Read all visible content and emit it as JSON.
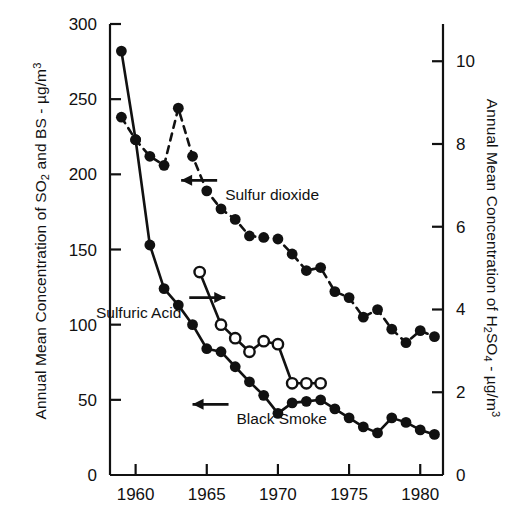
{
  "chart_data": {
    "type": "line",
    "title": "",
    "xlabel": "",
    "ylabel_left": "Annual Mean Concentration of SO2 and BS - µg/m3",
    "ylabel_right": "Annual Mean Concentration of H2SO4 - µg/m3",
    "x": [
      1959,
      1960,
      1961,
      1962,
      1963,
      1964,
      1965,
      1966,
      1967,
      1968,
      1969,
      1970,
      1971,
      1972,
      1973,
      1974,
      1975,
      1976,
      1977,
      1978,
      1979,
      1980,
      1981
    ],
    "xlim": [
      1958.2,
      1981.6
    ],
    "xticks": [
      1960,
      1965,
      1970,
      1975,
      1980
    ],
    "xticklabels": [
      "1960",
      "1965",
      "1970",
      "1975",
      "1980"
    ],
    "ylim_left": [
      0,
      300
    ],
    "yticks_left": [
      0,
      50,
      100,
      150,
      200,
      250,
      300
    ],
    "yticklabels_left": [
      "0",
      "50",
      "100",
      "150",
      "200",
      "250",
      "300"
    ],
    "ylim_right": [
      0,
      10.9
    ],
    "yticks_right": [
      0,
      2,
      4,
      6,
      8,
      10
    ],
    "yticklabels_right": [
      "0",
      "2",
      "4",
      "6",
      "8",
      "10"
    ],
    "grid": false,
    "legend": "inline-annotations",
    "series": [
      {
        "name": "Sulfur dioxide",
        "axis": "left",
        "marker": "filled-circle",
        "linestyle": "dashed",
        "x": [
          1959,
          1960,
          1961,
          1962,
          1963,
          1964,
          1965,
          1966,
          1967,
          1968,
          1969,
          1970,
          1971,
          1972,
          1973,
          1974,
          1975,
          1976,
          1977,
          1978,
          1979,
          1980,
          1981
        ],
        "values": [
          238,
          223,
          212,
          206,
          244,
          212,
          189,
          177,
          170,
          159,
          158,
          157,
          147,
          136,
          138,
          122,
          118,
          105,
          110,
          97,
          88,
          96,
          92
        ]
      },
      {
        "name": "Black Smoke",
        "axis": "left",
        "marker": "filled-circle",
        "linestyle": "solid",
        "x": [
          1959,
          1960,
          1961,
          1962,
          1963,
          1964,
          1965,
          1966,
          1967,
          1968,
          1969,
          1970,
          1971,
          1972,
          1973,
          1974,
          1975,
          1976,
          1977,
          1978,
          1979,
          1980,
          1981
        ],
        "values": [
          282,
          223,
          153,
          124,
          113,
          100,
          84,
          82,
          72,
          62,
          53,
          41,
          48,
          49,
          50,
          44,
          38,
          32,
          28,
          38,
          35,
          30,
          27
        ]
      },
      {
        "name": "Sulfuric Acid",
        "axis": "right",
        "marker": "open-circle",
        "linestyle": "solid",
        "x": [
          1964.5,
          1966,
          1967,
          1968,
          1969,
          1970,
          1971,
          1972,
          1973
        ],
        "values": [
          6.7,
          5.0,
          4.5,
          4.1,
          4.4,
          4.3,
          3.0,
          3.0,
          3.0
        ],
        "values_left_scale": [
          135,
          100,
          91,
          82,
          89,
          87,
          61,
          61,
          61
        ]
      }
    ],
    "annotations": [
      {
        "text": "Sulfur dioxide",
        "arrow": "left",
        "x": 1963.2,
        "y": 196
      },
      {
        "text": "Sulfuric Acid",
        "arrow": "right",
        "x": 1966.3,
        "y": 118
      },
      {
        "text": "Black Smoke",
        "arrow": "left",
        "x": 1964.0,
        "y": 47
      }
    ]
  },
  "axes": {
    "left_title_parts": {
      "a": "Annual Mean Concentration of SO",
      "sub1": "2",
      "b": " and BS - µg/m",
      "sup1": "3"
    },
    "right_title_parts": {
      "a": "Annual Mean Concentration of H",
      "sub1": "2",
      "b": "SO",
      "sub2": "4",
      "c": " - µg/m",
      "sup1": "3"
    }
  },
  "colors": {
    "ink": "#111111",
    "background": "#ffffff",
    "marker_fill": "#111111",
    "open_marker_fill": "#ffffff"
  }
}
